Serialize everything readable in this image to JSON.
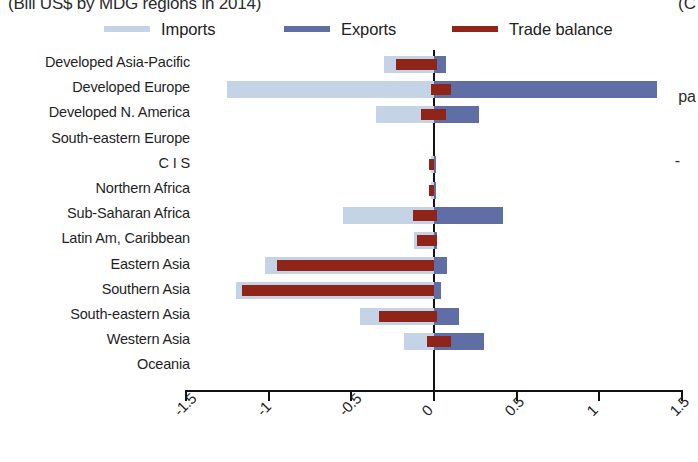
{
  "chart_data": {
    "type": "bar",
    "orientation": "horizontal",
    "title": "(Bill US$ by MDG regions in 2014)",
    "xlabel": "",
    "ylabel": "",
    "xlim": [
      -1.5,
      1.5
    ],
    "xticks": [
      -1.5,
      -1,
      -0.5,
      0,
      0.5,
      1,
      1.5
    ],
    "xtick_labels": [
      "-1.5",
      "-1",
      "-0.5",
      "0",
      "0.5",
      "1",
      "1.5"
    ],
    "grid": false,
    "legend_position": "top",
    "categories": [
      "Developed Asia-Pacific",
      "Developed Europe",
      "Developed N. America",
      "South-eastern Europe",
      "C I S",
      "Northern Africa",
      "Sub-Saharan Africa",
      "Latin Am, Caribbean",
      "Eastern Asia",
      "Southern Asia",
      "South-eastern Asia",
      "Western Asia",
      "Oceania"
    ],
    "series": [
      {
        "name": "Imports",
        "color": "#c5d3e6",
        "values": [
          -0.3,
          -1.25,
          -0.35,
          0.0,
          -0.02,
          -0.02,
          -0.55,
          -0.12,
          -1.02,
          -1.2,
          -0.45,
          -0.18,
          0.0
        ]
      },
      {
        "name": "Exports",
        "color": "#5f6fa5",
        "values": [
          0.07,
          1.35,
          0.27,
          0.0,
          0.01,
          0.01,
          0.42,
          0.02,
          0.08,
          0.04,
          0.15,
          0.3,
          0.0
        ]
      },
      {
        "name": "Trade balance",
        "color": "#8f2418",
        "values": [
          -0.23,
          0.1,
          0.07,
          0.0,
          -0.02,
          -0.02,
          -0.13,
          -0.1,
          -0.95,
          -1.16,
          -0.3,
          0.1,
          0.0
        ]
      }
    ],
    "balance_spans": [
      {
        "from": -0.23,
        "to": 0.02
      },
      {
        "from": -0.02,
        "to": 0.1
      },
      {
        "from": -0.08,
        "to": 0.07
      },
      {
        "from": 0.0,
        "to": 0.0
      },
      {
        "from": -0.03,
        "to": 0.0
      },
      {
        "from": -0.03,
        "to": 0.0
      },
      {
        "from": -0.13,
        "to": 0.02
      },
      {
        "from": -0.1,
        "to": 0.02
      },
      {
        "from": -0.95,
        "to": 0.0
      },
      {
        "from": -1.16,
        "to": 0.0
      },
      {
        "from": -0.33,
        "to": 0.02
      },
      {
        "from": -0.04,
        "to": 0.1
      },
      {
        "from": 0.0,
        "to": 0.0
      }
    ]
  },
  "legend": {
    "items": [
      {
        "label": "Imports",
        "color": "#c5d3e6"
      },
      {
        "label": "Exports",
        "color": "#5f6fa5"
      },
      {
        "label": "Trade balance",
        "color": "#8f2418"
      }
    ]
  },
  "fragments": {
    "top_right": "(C",
    "mid_right": "-",
    "lower_right": "pa"
  },
  "colors": {
    "imports": "#c5d3e6",
    "exports": "#5f6fa5",
    "balance": "#8f2418",
    "axis": "#111111",
    "text": "#1f1f1f",
    "background": "#ffffff"
  }
}
